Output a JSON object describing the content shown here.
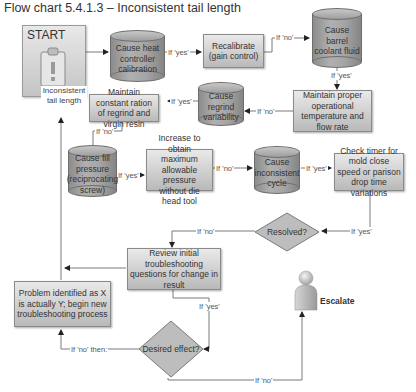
{
  "title": "Flow chart 5.4.1.3 – Inconsistent tail length",
  "start": {
    "label": "START",
    "caption": "Inconsistent tail length",
    "icon": "clipboard-warning-icon"
  },
  "nodes": {
    "cause_heat_controller": "Cause heat controller calibration",
    "recalibrate": "Recalibrate (gain control)",
    "cause_barrel_coolant": "Cause barrel coolant fluid",
    "maintain_temp_flow": "Maintain proper operational temperature and flow rate",
    "cause_regrind": "Cause regrind variability",
    "maintain_ratio": "Maintain constant ration of regrind and virgin resin",
    "cause_fill_pressure": "Cause fill pressure (reciprocating screw)",
    "increase_pressure": "Increase to obtain maximum allowable pressure without die head tool",
    "cause_inconsistent_cycle": "Cause inconsistent cycle",
    "check_timer": "Check timer for mold close speed or parison drop time variations",
    "resolved": "Resolved?",
    "review": "Review initial troubleshooting questions for change in result",
    "problem_identified": "Problem identified as X is actually Y; begin new troubleshooting process",
    "desired_effect": "Desired effect?",
    "escalate": "Escalate"
  },
  "edge_labels": {
    "heat_to_recal": "If 'yes'",
    "recal_to_barrel": "If 'no'",
    "barrel_to_maintain": "If 'yes'",
    "maintain_to_regrind": "If 'no'",
    "regrind_to_ratio": "If 'yes'",
    "ratio_to_fill": "If 'no'",
    "fill_to_increase": "If 'yes'",
    "increase_to_cycle": "If 'no'",
    "cycle_to_timer": "If 'yes'",
    "timer_to_resolved": "If 'yes'",
    "resolved_to_review": "If 'no'",
    "review_to_desired": "If 'yes'",
    "desired_to_problem": "If 'no' then:",
    "desired_to_escalate": "If 'no'"
  },
  "colors": {
    "box_fill": "#cfcfcf",
    "cylinder_fill": "#a5a5a5",
    "line": "#777777",
    "text": "#333333"
  }
}
